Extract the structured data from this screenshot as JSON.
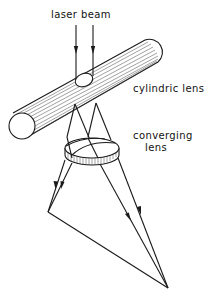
{
  "figure": {
    "type": "optical-setup-diagram",
    "labels": {
      "laser_beam": "laser beam",
      "cylindric_lens": "cylindric lens",
      "converging_lens_line1": "converging",
      "converging_lens_line2": "lens"
    },
    "colors": {
      "line": "#1a1a1a",
      "background": "#ffffff"
    },
    "components": [
      {
        "name": "laser beam",
        "kind": "two parallel vertical rays with arrows"
      },
      {
        "name": "cylindric lens",
        "kind": "long hatched cylinder, diagonal"
      },
      {
        "name": "converging lens",
        "kind": "disc lens with hatched rim"
      },
      {
        "name": "projected light sheet",
        "kind": "triangle formed by converging rays"
      }
    ]
  }
}
